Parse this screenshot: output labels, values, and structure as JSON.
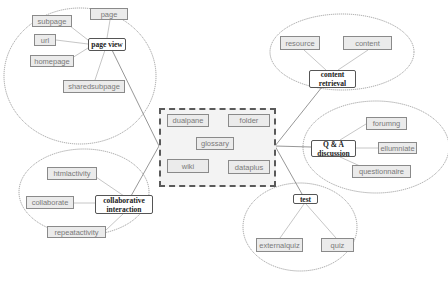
{
  "diagram": {
    "center_group": {
      "items": [
        "dualpane",
        "folder",
        "glossary",
        "wiki",
        "dataplus"
      ]
    },
    "clusters": [
      {
        "hub": "page view",
        "items": [
          "page",
          "subpage",
          "url",
          "homepage",
          "sharedsubpage"
        ]
      },
      {
        "hub_line1": "collaborative",
        "hub_line2": "interaction",
        "items": [
          "htmlactivity",
          "collaborate",
          "repeatactivity"
        ]
      },
      {
        "hub_line1": "content",
        "hub_line2": "retrieval",
        "items": [
          "resource",
          "content"
        ]
      },
      {
        "hub_line1": "Q & A",
        "hub_line2": "discussion",
        "items": [
          "forumng",
          "ellumniate",
          "questionnaire"
        ]
      },
      {
        "hub": "test",
        "items": [
          "externalquiz",
          "quiz"
        ]
      }
    ]
  },
  "colors": {
    "leaf_fill": "#ebebeb",
    "leaf_border": "#8a8a8a",
    "hub_border": "#555555",
    "ellipse_stroke": "#888888",
    "connector": "#a0a0a0",
    "center_border": "#5a5a5a"
  }
}
